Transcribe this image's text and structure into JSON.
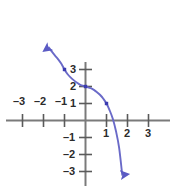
{
  "chart_data": {
    "type": "line",
    "title": "",
    "subtitle": "",
    "xlabel": "",
    "ylabel": "",
    "xlim": [
      -3.9,
      3.5
    ],
    "ylim": [
      -3.6,
      3.9
    ],
    "grid": false,
    "legend": false,
    "x_ticks": [
      -3,
      -2,
      -1,
      1,
      2,
      3
    ],
    "y_ticks": [
      3,
      2,
      1,
      -1,
      -2,
      -3
    ],
    "x_tick_labels": [
      "–3",
      "–2",
      "–1",
      "1",
      "2",
      "3"
    ],
    "y_tick_labels": [
      "3",
      "2",
      "1",
      "–1",
      "–2",
      "–3"
    ],
    "axis_color": "#7a7a7a",
    "curve_color": "#6a6ac8",
    "marker_color": "#3b3bb0",
    "label_color": "#2b2b2b",
    "series": [
      {
        "name": "curve",
        "start_arrow": true,
        "end_arrow": true,
        "marked_points": [
          {
            "x": -1,
            "y": 3
          },
          {
            "x": 0,
            "y": 2
          },
          {
            "x": 1,
            "y": 1
          }
        ],
        "x": [
          -1.75,
          -1.6,
          -1.45,
          -1.3,
          -1.15,
          -1.0,
          -0.85,
          -0.7,
          -0.55,
          -0.4,
          -0.25,
          0.0,
          0.25,
          0.4,
          0.55,
          0.7,
          0.85,
          1.0,
          1.15,
          1.3,
          1.45,
          1.6,
          1.75
        ],
        "y": [
          4.3,
          4.05,
          3.82,
          3.6,
          3.34,
          3.0,
          2.72,
          2.52,
          2.36,
          2.22,
          2.1,
          2.0,
          1.9,
          1.8,
          1.66,
          1.5,
          1.28,
          1.0,
          0.6,
          0.1,
          -0.62,
          -1.6,
          -3.2
        ]
      }
    ]
  },
  "axis_labels": {
    "x_neg3": "–3",
    "x_neg2": "–2",
    "x_neg1": "–1",
    "x_pos1": "1",
    "x_pos2": "2",
    "x_pos3": "3",
    "y_pos3": "3",
    "y_pos2": "2",
    "y_pos1": "1",
    "y_neg1": "–1",
    "y_neg2": "–2",
    "y_neg3": "–3"
  }
}
